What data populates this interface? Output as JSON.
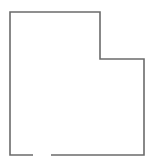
{
  "figure": {
    "title": "",
    "background_color": "#ffffff",
    "stroke_color": "#6b6b6b",
    "fill_color": "none",
    "stroke_width": 1.6,
    "canvas": {
      "width": 159,
      "height": 165
    },
    "outline": {
      "shape_type": "notched-rectangle",
      "vertices": [
        {
          "label": "top-left",
          "x": 10,
          "y": 12
        },
        {
          "label": "top-right-of-upper-block",
          "x": 100,
          "y": 12
        },
        {
          "label": "notch-inner-corner",
          "x": 100,
          "y": 59
        },
        {
          "label": "right-top",
          "x": 144,
          "y": 59
        },
        {
          "label": "bottom-right",
          "x": 144,
          "y": 155
        },
        {
          "label": "bottom-left",
          "x": 10,
          "y": 155
        }
      ],
      "segments": [
        {
          "name": "top-edge",
          "from": [
            10,
            12
          ],
          "to": [
            100,
            12
          ]
        },
        {
          "name": "notch-vertical-edge",
          "from": [
            100,
            12
          ],
          "to": [
            100,
            59
          ]
        },
        {
          "name": "notch-horizontal-edge",
          "from": [
            100,
            59
          ],
          "to": [
            144,
            59
          ]
        },
        {
          "name": "right-edge",
          "from": [
            144,
            59
          ],
          "to": [
            144,
            155
          ]
        },
        {
          "name": "bottom-edge-right-portion",
          "from": [
            144,
            155
          ],
          "to": [
            51,
            155
          ]
        },
        {
          "name": "bottom-edge-gap",
          "from": [
            51,
            155
          ],
          "to": [
            33,
            155
          ],
          "rendered": false
        },
        {
          "name": "bottom-edge-left-portion",
          "from": [
            33,
            155
          ],
          "to": [
            10,
            155
          ]
        },
        {
          "name": "left-edge",
          "from": [
            10,
            155
          ],
          "to": [
            10,
            12
          ]
        }
      ],
      "gap": {
        "present": true,
        "edge": "bottom-edge",
        "x_start": 33,
        "x_end": 51,
        "y": 155
      }
    }
  }
}
